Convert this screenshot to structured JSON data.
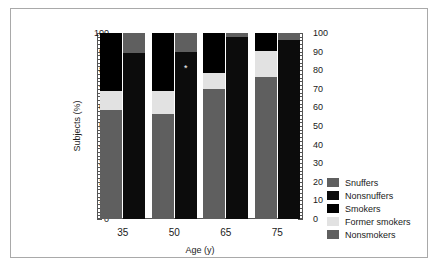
{
  "chart_data": {
    "type": "bar",
    "subtype": "stacked-grouped",
    "title": "",
    "xlabel": "Age (y)",
    "ylabel": "Subjects (%)",
    "categories": [
      "35",
      "50",
      "65",
      "75"
    ],
    "ylim": [
      0,
      100
    ],
    "ytick_labels": [
      "0",
      "10",
      "20",
      "30",
      "40",
      "50",
      "60",
      "70",
      "80",
      "90",
      "100"
    ],
    "ytick_values": [
      0,
      10,
      20,
      30,
      40,
      50,
      60,
      70,
      80,
      90,
      100
    ],
    "minor_tick_step": 2,
    "dual_y_axis": true,
    "grid": false,
    "legend_position": "right",
    "bars_per_group": 2,
    "bar_groups": [
      {
        "name": "smoking-status",
        "stack_order": [
          "Nonsmokers",
          "Former smokers",
          "Smokers"
        ],
        "values": {
          "Nonsmokers": [
            58.5,
            56.5,
            70.0,
            76.5
          ],
          "Former smokers": [
            10.5,
            12.5,
            8.5,
            14.0
          ],
          "Smokers": [
            31.0,
            31.0,
            21.5,
            9.5
          ]
        },
        "cumulative_tops": {
          "Nonsmokers": [
            58.5,
            56.5,
            70.0,
            76.5
          ],
          "Former smokers": [
            69.0,
            69.0,
            78.5,
            90.5
          ],
          "Smokers": [
            100,
            100,
            100,
            100
          ]
        }
      },
      {
        "name": "snuff-status",
        "stack_order": [
          "Nonsnuffers",
          "Snuffers"
        ],
        "values": {
          "Nonsnuffers": [
            89.5,
            90.0,
            98.0,
            96.0
          ],
          "Snuffers": [
            10.5,
            10.0,
            2.0,
            4.0
          ]
        },
        "cumulative_tops": {
          "Nonsnuffers": [
            89.5,
            90.0,
            98.0,
            96.0
          ],
          "Snuffers": [
            100,
            100,
            100,
            100
          ]
        }
      }
    ],
    "annotations": [
      {
        "symbol": "*",
        "category": "50",
        "bar": "snuff-status",
        "value": 84
      }
    ],
    "legend": [
      {
        "label": "Snuffers",
        "color": "#5f5f5f"
      },
      {
        "label": "Nonsnuffers",
        "color": "#0c0c0c"
      },
      {
        "label": "Smokers",
        "color": "#000000"
      },
      {
        "label": "Former smokers",
        "color": "#e2e2e2"
      },
      {
        "label": "Nonsmokers",
        "color": "#5f5f5f"
      }
    ]
  }
}
